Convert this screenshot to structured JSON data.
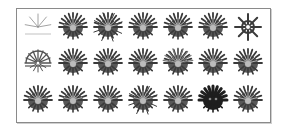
{
  "figure": {
    "frame_color": "#8a8a8a",
    "glyph_color": "#3a3a3a",
    "columns": 7,
    "rows": 3,
    "glyphs": [
      {
        "row": 0,
        "col": 0,
        "name": "sparse-fan-glyph",
        "variant": "lines"
      },
      {
        "row": 0,
        "col": 1,
        "name": "dense-burst-glyph",
        "variant": "dense"
      },
      {
        "row": 0,
        "col": 2,
        "name": "dense-burst-glyph",
        "variant": "spiky"
      },
      {
        "row": 0,
        "col": 3,
        "name": "dense-burst-glyph",
        "variant": "dense"
      },
      {
        "row": 0,
        "col": 4,
        "name": "dense-burst-glyph",
        "variant": "dense"
      },
      {
        "row": 0,
        "col": 5,
        "name": "dense-burst-glyph",
        "variant": "dense"
      },
      {
        "row": 0,
        "col": 6,
        "name": "open-star-glyph",
        "variant": "star"
      },
      {
        "row": 1,
        "col": 0,
        "name": "open-wheel-glyph",
        "variant": "wheel"
      },
      {
        "row": 1,
        "col": 1,
        "name": "dense-burst-glyph",
        "variant": "dense"
      },
      {
        "row": 1,
        "col": 2,
        "name": "dense-burst-glyph",
        "variant": "dense"
      },
      {
        "row": 1,
        "col": 3,
        "name": "dense-burst-glyph",
        "variant": "dense"
      },
      {
        "row": 1,
        "col": 4,
        "name": "dense-burst-glyph",
        "variant": "fan"
      },
      {
        "row": 1,
        "col": 5,
        "name": "dense-burst-glyph",
        "variant": "dense"
      },
      {
        "row": 1,
        "col": 6,
        "name": "dense-burst-glyph",
        "variant": "dense"
      },
      {
        "row": 2,
        "col": 0,
        "name": "dense-burst-glyph",
        "variant": "dense"
      },
      {
        "row": 2,
        "col": 1,
        "name": "dense-burst-glyph",
        "variant": "dense"
      },
      {
        "row": 2,
        "col": 2,
        "name": "dense-burst-glyph",
        "variant": "dense"
      },
      {
        "row": 2,
        "col": 3,
        "name": "dense-burst-glyph",
        "variant": "spiky"
      },
      {
        "row": 2,
        "col": 4,
        "name": "dense-burst-glyph",
        "variant": "dense"
      },
      {
        "row": 2,
        "col": 5,
        "name": "solid-burst-glyph",
        "variant": "solid"
      },
      {
        "row": 2,
        "col": 6,
        "name": "dense-burst-glyph",
        "variant": "dense"
      }
    ]
  }
}
